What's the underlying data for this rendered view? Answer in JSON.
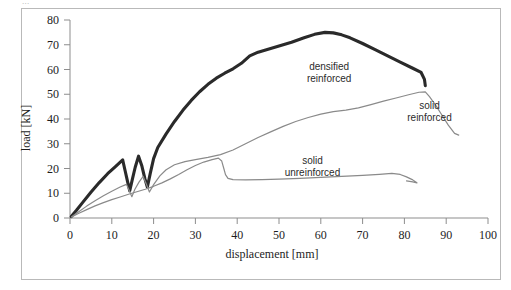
{
  "figure": {
    "top_caption": "...",
    "background_color": "#ffffff",
    "frame_color": "#b9b9b9"
  },
  "chart_data": {
    "type": "line",
    "title": "",
    "xlabel": "displacement [mm]",
    "ylabel": "load [kN]",
    "xlim": [
      0,
      100
    ],
    "ylim": [
      0,
      80
    ],
    "xticks": [
      0,
      10,
      20,
      30,
      40,
      50,
      60,
      70,
      80,
      90,
      100
    ],
    "yticks": [
      0,
      10,
      20,
      30,
      40,
      50,
      60,
      70,
      80
    ],
    "xtick_labels": [
      "0",
      "10",
      "20",
      "30",
      "40",
      "50",
      "60",
      "70",
      "80",
      "90",
      "100"
    ],
    "ytick_labels": [
      "0",
      "10",
      "20",
      "30",
      "40",
      "50",
      "60",
      "70",
      "80"
    ],
    "grid": false,
    "legend_position": "inline-annotations",
    "annotations": [
      {
        "name": "densified-reinforced",
        "lines": [
          "densified",
          "reinforced"
        ],
        "x": 62,
        "y": 60
      },
      {
        "name": "solid-reinforced",
        "lines": [
          "solid",
          "reinforced"
        ],
        "x": 86,
        "y": 44
      },
      {
        "name": "solid-unreinforced",
        "lines": [
          "solid",
          "unreinforced"
        ],
        "x": 58,
        "y": 22
      }
    ],
    "series": [
      {
        "name": "densified reinforced",
        "color": "#2a2a2a",
        "linewidth": 3.1,
        "points": [
          [
            0.3,
            0.6
          ],
          [
            1.5,
            3.0
          ],
          [
            3.0,
            6.2
          ],
          [
            5.0,
            10.4
          ],
          [
            7.0,
            14.3
          ],
          [
            9.0,
            17.9
          ],
          [
            11.0,
            21.0
          ],
          [
            12.6,
            23.5
          ],
          [
            13.2,
            19.0
          ],
          [
            13.8,
            14.5
          ],
          [
            14.3,
            11.0
          ],
          [
            14.9,
            15.5
          ],
          [
            15.6,
            20.5
          ],
          [
            16.4,
            25.0
          ],
          [
            17.2,
            21.0
          ],
          [
            17.9,
            16.0
          ],
          [
            18.5,
            12.5
          ],
          [
            19.2,
            18.0
          ],
          [
            20.0,
            24.0
          ],
          [
            21.0,
            28.5
          ],
          [
            23.0,
            34.0
          ],
          [
            25.0,
            39.0
          ],
          [
            27.0,
            43.5
          ],
          [
            29.0,
            47.5
          ],
          [
            31.0,
            51.0
          ],
          [
            33.0,
            54.0
          ],
          [
            35.0,
            56.5
          ],
          [
            37.0,
            58.5
          ],
          [
            39.0,
            60.3
          ],
          [
            41.0,
            62.5
          ],
          [
            43.0,
            65.5
          ],
          [
            45.0,
            67.0
          ],
          [
            47.0,
            68.0
          ],
          [
            50.0,
            69.5
          ],
          [
            53.0,
            71.0
          ],
          [
            56.0,
            72.8
          ],
          [
            58.5,
            74.2
          ],
          [
            61.0,
            75.0
          ],
          [
            63.0,
            74.8
          ],
          [
            65.0,
            74.0
          ],
          [
            67.0,
            72.8
          ],
          [
            70.0,
            70.5
          ],
          [
            73.0,
            68.0
          ],
          [
            76.0,
            65.5
          ],
          [
            79.0,
            63.0
          ],
          [
            82.0,
            60.5
          ],
          [
            84.0,
            58.8
          ],
          [
            84.8,
            56.0
          ],
          [
            85.0,
            53.5
          ]
        ]
      },
      {
        "name": "solid reinforced",
        "color": "#8a8a8a",
        "linewidth": 1.2,
        "points": [
          [
            0.4,
            0.5
          ],
          [
            2.0,
            2.4
          ],
          [
            4.0,
            4.8
          ],
          [
            6.0,
            7.0
          ],
          [
            8.0,
            9.0
          ],
          [
            10.0,
            10.8
          ],
          [
            12.0,
            12.5
          ],
          [
            13.5,
            13.6
          ],
          [
            14.2,
            11.0
          ],
          [
            14.8,
            8.6
          ],
          [
            15.5,
            11.5
          ],
          [
            16.5,
            14.5
          ],
          [
            17.5,
            16.8
          ],
          [
            18.3,
            13.5
          ],
          [
            19.0,
            10.5
          ],
          [
            20.0,
            13.5
          ],
          [
            21.5,
            17.0
          ],
          [
            23.0,
            19.5
          ],
          [
            25.0,
            21.5
          ],
          [
            27.5,
            22.8
          ],
          [
            30.0,
            23.6
          ],
          [
            33.0,
            24.5
          ],
          [
            36.0,
            25.6
          ],
          [
            39.0,
            27.5
          ],
          [
            42.0,
            30.0
          ],
          [
            45.0,
            32.5
          ],
          [
            48.0,
            34.8
          ],
          [
            51.0,
            37.0
          ],
          [
            54.0,
            39.0
          ],
          [
            57.0,
            40.6
          ],
          [
            60.0,
            42.0
          ],
          [
            63.0,
            43.0
          ],
          [
            66.0,
            43.6
          ],
          [
            69.0,
            44.5
          ],
          [
            72.0,
            45.8
          ],
          [
            75.0,
            47.2
          ],
          [
            78.0,
            48.5
          ],
          [
            81.0,
            49.8
          ],
          [
            83.5,
            50.8
          ],
          [
            85.0,
            51.0
          ],
          [
            86.0,
            49.0
          ],
          [
            87.5,
            45.5
          ],
          [
            89.0,
            41.5
          ],
          [
            90.5,
            37.5
          ],
          [
            92.0,
            34.2
          ],
          [
            93.0,
            33.5
          ]
        ]
      },
      {
        "name": "solid unreinforced",
        "color": "#8a8a8a",
        "linewidth": 1.2,
        "points": [
          [
            0.4,
            0.4
          ],
          [
            2.0,
            1.8
          ],
          [
            4.0,
            3.4
          ],
          [
            6.0,
            4.9
          ],
          [
            8.0,
            6.2
          ],
          [
            10.0,
            7.4
          ],
          [
            12.0,
            8.5
          ],
          [
            14.0,
            9.6
          ],
          [
            16.0,
            10.6
          ],
          [
            18.0,
            11.6
          ],
          [
            20.0,
            12.8
          ],
          [
            22.0,
            14.2
          ],
          [
            24.0,
            15.8
          ],
          [
            26.0,
            17.6
          ],
          [
            28.0,
            19.5
          ],
          [
            30.0,
            21.2
          ],
          [
            32.0,
            22.6
          ],
          [
            34.0,
            23.6
          ],
          [
            35.5,
            24.2
          ],
          [
            36.3,
            23.0
          ],
          [
            36.8,
            20.0
          ],
          [
            37.2,
            17.5
          ],
          [
            37.8,
            16.0
          ],
          [
            39.0,
            15.5
          ],
          [
            42.0,
            15.4
          ],
          [
            46.0,
            15.5
          ],
          [
            50.0,
            15.7
          ],
          [
            55.0,
            16.0
          ],
          [
            60.0,
            16.4
          ],
          [
            65.0,
            16.8
          ],
          [
            70.0,
            17.2
          ],
          [
            74.0,
            17.6
          ],
          [
            77.0,
            18.0
          ],
          [
            79.0,
            17.6
          ],
          [
            80.5,
            16.6
          ],
          [
            82.0,
            15.4
          ],
          [
            83.0,
            14.2
          ],
          [
            82.0,
            14.6
          ],
          [
            80.5,
            15.0
          ]
        ]
      }
    ]
  }
}
